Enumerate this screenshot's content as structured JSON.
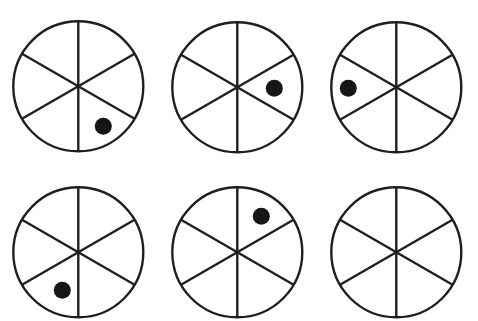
{
  "canvas": {
    "width": 478,
    "height": 321,
    "background_color": "#ffffff",
    "ink_color": "#1f1f1f",
    "dot_color": "#161616",
    "stroke_width": 2.4,
    "dot_radius": 8.5
  },
  "figure": {
    "shape": "circle",
    "sector_count": 6,
    "divider_count": 3,
    "divider_angles_deg": [
      90,
      30,
      150
    ],
    "circle_radius": 65,
    "sector_labels": [
      "top-right",
      "right",
      "bottom-right",
      "bottom-left",
      "left",
      "top-left"
    ]
  },
  "grid": {
    "rows": 2,
    "columns": 3
  },
  "cells": [
    {
      "id": "cell-1",
      "position": "row-1-col-1",
      "center_x": 78,
      "center_y": 86,
      "radius": 65,
      "dot": {
        "present": true,
        "sector": "bottom-right",
        "sector_index": 2,
        "angle_deg": -60,
        "x": 103,
        "y": 126,
        "radius": 8.5
      }
    },
    {
      "id": "cell-2",
      "position": "row-1-col-2",
      "center_x": 237,
      "center_y": 87,
      "radius": 65,
      "dot": {
        "present": true,
        "sector": "right",
        "sector_index": 1,
        "angle_deg": 0,
        "x": 274,
        "y": 88,
        "radius": 8.5
      }
    },
    {
      "id": "cell-3",
      "position": "row-1-col-3",
      "center_x": 396,
      "center_y": 87,
      "radius": 65,
      "dot": {
        "present": true,
        "sector": "left",
        "sector_index": 4,
        "angle_deg": 180,
        "x": 348,
        "y": 88,
        "radius": 8.5
      }
    },
    {
      "id": "cell-4",
      "position": "row-2-col-1",
      "center_x": 78,
      "center_y": 252,
      "radius": 65,
      "dot": {
        "present": true,
        "sector": "bottom-left",
        "sector_index": 3,
        "angle_deg": -120,
        "x": 62,
        "y": 290,
        "radius": 8.5
      }
    },
    {
      "id": "cell-5",
      "position": "row-2-col-2",
      "center_x": 237,
      "center_y": 252,
      "radius": 65,
      "dot": {
        "present": true,
        "sector": "top-right",
        "sector_index": 0,
        "angle_deg": 60,
        "x": 261,
        "y": 216,
        "radius": 8.5
      }
    },
    {
      "id": "cell-6",
      "position": "row-2-col-3",
      "center_x": 396,
      "center_y": 252,
      "radius": 65,
      "dot": {
        "present": false,
        "sector": "",
        "sector_index": -1,
        "angle_deg": 0,
        "x": 0,
        "y": 0,
        "radius": 8.5
      }
    }
  ]
}
